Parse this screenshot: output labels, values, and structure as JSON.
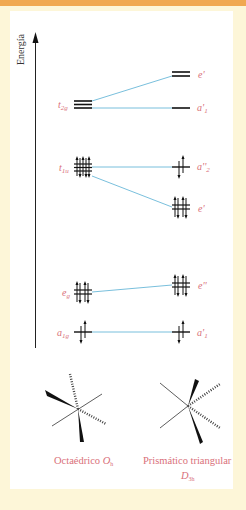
{
  "diagram": {
    "axis_label": "Energía",
    "colors": {
      "label": "#d9707a",
      "connector": "#6ab8d8",
      "level": "#111111",
      "frame_top": "#f0a850",
      "background": "#fdf6d8"
    },
    "left_levels": [
      {
        "symbol": "t",
        "sub": "2g",
        "electrons": 0,
        "degeneracy": 3
      },
      {
        "symbol": "t",
        "sub": "1u",
        "electrons": 6,
        "degeneracy": 3
      },
      {
        "symbol": "e",
        "sub": "g",
        "electrons": 4,
        "degeneracy": 2
      },
      {
        "symbol": "a",
        "sub": "1g",
        "electrons": 2,
        "degeneracy": 1
      }
    ],
    "right_levels": [
      {
        "symbol": "e'",
        "sub": "",
        "electrons": 0,
        "degeneracy": 2
      },
      {
        "symbol": "a'",
        "sub": "1",
        "electrons": 0,
        "degeneracy": 1
      },
      {
        "symbol": "a''",
        "sub": "2",
        "electrons": 2,
        "degeneracy": 1
      },
      {
        "symbol": "e'",
        "sub": "",
        "electrons": 4,
        "degeneracy": 2
      },
      {
        "symbol": "e''",
        "sub": "",
        "electrons": 4,
        "degeneracy": 2
      },
      {
        "symbol": "a'",
        "sub": "1",
        "electrons": 2,
        "degeneracy": 1
      }
    ],
    "captions": {
      "left": "Octaédrico",
      "left_group": "O",
      "left_group_sub": "h",
      "right": "Prismático triangular",
      "right_group": "D",
      "right_group_sub": "3h"
    }
  }
}
